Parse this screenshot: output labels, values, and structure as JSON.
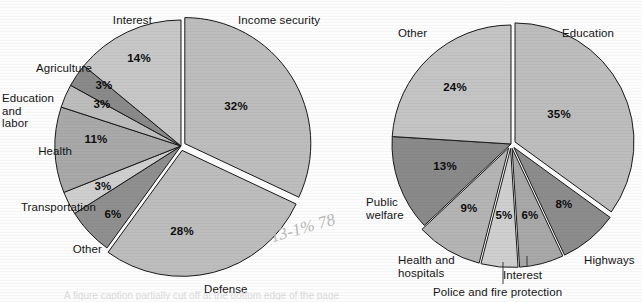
{
  "figure": {
    "background_color": "#fdfdfd",
    "ink_color": "#141414",
    "slice_edge_color": "#1a1a1a",
    "gap_color": "#ffffff",
    "annotation_scribble": "13-1%  78",
    "bottom_cut_caption": "A figure caption partially cut off at the bottom edge of the page"
  },
  "chart_data": [
    {
      "type": "pie",
      "title": "",
      "id": "federal-spending-pie",
      "position": "left",
      "center": [
        181,
        146
      ],
      "radius": 126,
      "start_angle_deg": 0,
      "direction": "clockwise",
      "legend": "none",
      "labels_placement": "outside-with-callouts",
      "categories": [
        "Income security",
        "Defense",
        "Other",
        "Transportation",
        "Health",
        "Education and labor",
        "Agriculture",
        "Interest"
      ],
      "values": [
        32,
        28,
        6,
        3,
        11,
        3,
        3,
        14
      ],
      "value_labels": [
        "32%",
        "28%",
        "6%",
        "3%",
        "11%",
        "3%",
        "3%",
        "14%"
      ],
      "colors": [
        "#bdbdbd",
        "#bdbdbd",
        "#8f8f8f",
        "#cfcfcf",
        "#a9a9a9",
        "#bdbdbd",
        "#8a8a8a",
        "#c7c7c7"
      ],
      "exploded": [
        true,
        true,
        false,
        false,
        false,
        false,
        false,
        false
      ]
    },
    {
      "type": "pie",
      "title": "",
      "id": "state-local-spending-pie",
      "position": "right",
      "center": [
        511,
        144
      ],
      "radius": 119,
      "start_angle_deg": 0,
      "direction": "clockwise",
      "legend": "none",
      "labels_placement": "outside-with-callouts",
      "categories": [
        "Education",
        "Highways",
        "Interest",
        "Police and fire protection",
        "Health and hospitals",
        "Public welfare",
        "Other"
      ],
      "values": [
        35,
        8,
        6,
        5,
        9,
        13,
        24
      ],
      "value_labels": [
        "35%",
        "8%",
        "6%",
        "5%",
        "9%",
        "13%",
        "24%"
      ],
      "colors": [
        "#bdbdbd",
        "#8c8c8c",
        "#a8a8a8",
        "#cfcfcf",
        "#b4b4b4",
        "#8a8a8a",
        "#c4c4c4"
      ],
      "exploded": [
        true,
        true,
        true,
        true,
        true,
        false,
        false
      ]
    }
  ],
  "left_chart": {
    "labels": [
      {
        "key": "interest",
        "text": "Interest",
        "x": 62,
        "y": 14,
        "w": 90,
        "align": "right"
      },
      {
        "key": "agriculture",
        "text": "Agriculture",
        "x": 2,
        "y": 62,
        "w": 90,
        "align": "right"
      },
      {
        "key": "education_labor",
        "text": "Education\nand\nlabor",
        "x": 2,
        "y": 92,
        "w": 78,
        "align": "left"
      },
      {
        "key": "health",
        "text": "Health",
        "x": 2,
        "y": 145,
        "w": 70,
        "align": "right"
      },
      {
        "key": "transportation",
        "text": "Transportation",
        "x": 0,
        "y": 201,
        "w": 96,
        "align": "right"
      },
      {
        "key": "other",
        "text": "Other",
        "x": 38,
        "y": 243,
        "w": 64,
        "align": "right"
      },
      {
        "key": "defense",
        "text": "Defense",
        "x": 204,
        "y": 283,
        "w": 70,
        "align": "left"
      },
      {
        "key": "income_security",
        "text": "Income security",
        "x": 238,
        "y": 14,
        "w": 104,
        "align": "left"
      }
    ],
    "pct_positions": [
      {
        "key": "income_security",
        "text": "32%",
        "x": 236,
        "y": 110
      },
      {
        "key": "defense",
        "text": "28%",
        "x": 182,
        "y": 235
      },
      {
        "key": "other",
        "text": "6%",
        "x": 113,
        "y": 218
      },
      {
        "key": "transportation",
        "text": "3%",
        "x": 103,
        "y": 190
      },
      {
        "key": "health",
        "text": "11%",
        "x": 96,
        "y": 143
      },
      {
        "key": "education_labor",
        "text": "3%",
        "x": 102,
        "y": 108
      },
      {
        "key": "agriculture",
        "text": "3%",
        "x": 104,
        "y": 89
      },
      {
        "key": "interest",
        "text": "14%",
        "x": 139,
        "y": 62
      }
    ]
  },
  "right_chart": {
    "labels": [
      {
        "key": "other",
        "text": "Other",
        "x": 398,
        "y": 27,
        "w": 60,
        "align": "left"
      },
      {
        "key": "education",
        "text": "Education",
        "x": 562,
        "y": 27,
        "w": 78,
        "align": "left"
      },
      {
        "key": "public_welfare",
        "text": "Public\nwelfare",
        "x": 366,
        "y": 196,
        "w": 62,
        "align": "left"
      },
      {
        "key": "health_hospitals",
        "text": "Health and\nhospitals",
        "x": 398,
        "y": 254,
        "w": 84,
        "align": "left"
      },
      {
        "key": "police_fire",
        "text": "Police and fire protection",
        "x": 433,
        "y": 286,
        "w": 160,
        "align": "left"
      },
      {
        "key": "interest",
        "text": "Interest",
        "x": 503,
        "y": 269,
        "w": 56,
        "align": "left"
      },
      {
        "key": "highways",
        "text": "Highways",
        "x": 584,
        "y": 254,
        "w": 62,
        "align": "left"
      }
    ],
    "pct_positions": [
      {
        "key": "education",
        "text": "35%",
        "x": 559,
        "y": 118
      },
      {
        "key": "highways",
        "text": "8%",
        "x": 564,
        "y": 208
      },
      {
        "key": "interest",
        "text": "6%",
        "x": 530,
        "y": 219
      },
      {
        "key": "police_fire",
        "text": "5%",
        "x": 504,
        "y": 219
      },
      {
        "key": "health_hospitals",
        "text": "9%",
        "x": 469,
        "y": 212
      },
      {
        "key": "public_welfare",
        "text": "13%",
        "x": 445,
        "y": 170
      },
      {
        "key": "other",
        "text": "24%",
        "x": 455,
        "y": 91
      }
    ],
    "leader_lines": [
      {
        "key": "police_fire-leader",
        "x1": 503,
        "y1": 262,
        "x2": 503,
        "y2": 284
      },
      {
        "key": "interest-leader",
        "x1": 527,
        "y1": 256,
        "x2": 527,
        "y2": 266
      }
    ]
  }
}
